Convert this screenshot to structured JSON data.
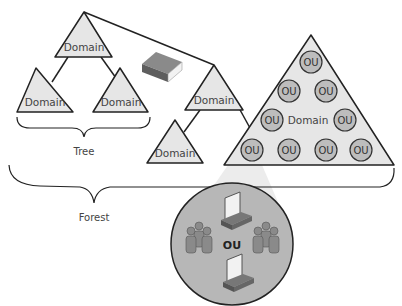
{
  "colors": {
    "triangle_fill": "#e6e6e6",
    "stroke": "#222222",
    "ou_fill": "#bdbdbd",
    "zoom_circle_fill": "#b7b7b7",
    "spotlight": "#ececec",
    "book_cover": "#6f6f6f",
    "book_pages": "#f2f2f2",
    "person": "#8a8a8a"
  },
  "tree": {
    "label": "Tree",
    "root_domain": "Domain",
    "left_child": "Domain",
    "right_child": "Domain"
  },
  "second_tree": {
    "root_domain": "Domain",
    "child_domain": "Domain"
  },
  "big_domain": {
    "label": "Domain",
    "ous": [
      "OU",
      "OU",
      "OU",
      "OU",
      "OU",
      "OU",
      "OU",
      "OU",
      "OU"
    ]
  },
  "forest": {
    "label": "Forest"
  },
  "ou_detail": {
    "label": "OU",
    "icons": [
      "computer-icon",
      "user-group-icon",
      "user-group-icon",
      "computer-icon"
    ]
  },
  "schema_icon": "book-icon"
}
